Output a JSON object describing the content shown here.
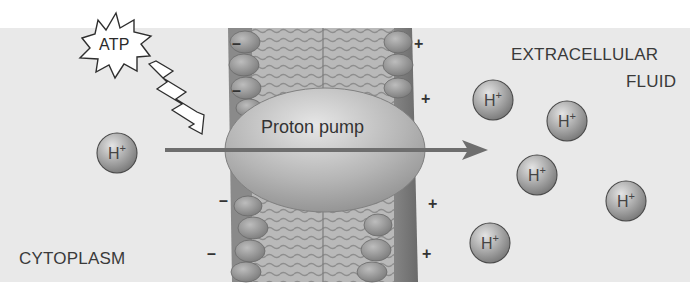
{
  "diagram": {
    "title": "Proton pump",
    "energy_source": {
      "label": "ATP",
      "icon": "starburst-icon"
    },
    "regions": {
      "inside": {
        "label": "CYTOPLASM"
      },
      "outside": {
        "label_line1": "EXTRACELLULAR",
        "label_line2": "FLUID"
      }
    },
    "pump": {
      "label": "Proton pump"
    },
    "membrane_charges": {
      "inside_sign": "–",
      "outside_sign": "+",
      "inside_positions": [
        [
          237,
          46
        ],
        [
          237,
          92
        ],
        [
          224,
          200
        ],
        [
          213,
          255
        ]
      ],
      "outside_positions": [
        [
          420,
          44
        ],
        [
          425,
          98
        ],
        [
          430,
          204
        ],
        [
          426,
          253
        ]
      ]
    },
    "ions": {
      "symbol": "H",
      "charge": "+",
      "cytoplasm": [
        {
          "cx": 117,
          "cy": 153
        }
      ],
      "extracellular": [
        {
          "cx": 493,
          "cy": 100
        },
        {
          "cx": 567,
          "cy": 121
        },
        {
          "cx": 537,
          "cy": 175
        },
        {
          "cx": 626,
          "cy": 201
        },
        {
          "cx": 490,
          "cy": 243
        }
      ]
    },
    "transport_arrow": {
      "from": "cytoplasm",
      "to": "extracellular fluid",
      "color": "#6e6e6e"
    },
    "colors": {
      "background": "#e9e9e9",
      "membrane": "#8c8c8c",
      "pump": "#b3b3b3",
      "ion": "#a8a8a8"
    }
  }
}
